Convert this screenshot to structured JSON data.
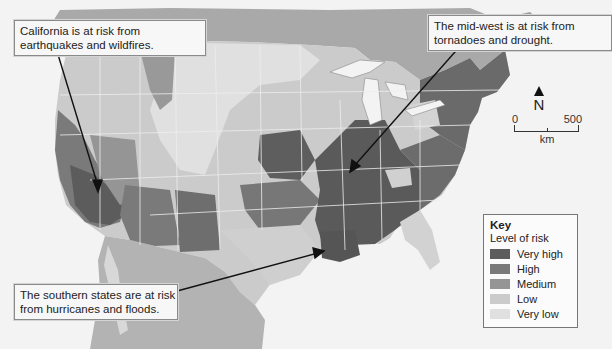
{
  "map": {
    "title": "Natural hazard risk levels across the United States",
    "callouts": [
      {
        "id": "california",
        "lines": [
          "California is at risk from",
          "earthquakes and wildfires."
        ]
      },
      {
        "id": "midwest",
        "lines": [
          "The mid-west is at risk from",
          "tornadoes and drought."
        ]
      },
      {
        "id": "south",
        "lines": [
          "The southern states are at risk",
          "from hurricanes and floods."
        ]
      }
    ],
    "key": {
      "title": "Key",
      "subtitle": "Level of risk",
      "levels": [
        {
          "label": "Very high",
          "color": "#5c5c5c"
        },
        {
          "label": "High",
          "color": "#7a7a7a"
        },
        {
          "label": "Medium",
          "color": "#959595"
        },
        {
          "label": "Low",
          "color": "#cbcbcb"
        },
        {
          "label": "Very low",
          "color": "#e0e0e0"
        }
      ]
    },
    "north_arrow": {
      "label": "N"
    },
    "scale_bar": {
      "start": "0",
      "end": "500",
      "unit": "km"
    },
    "colors": {
      "ocean": "#f3f3f3",
      "canada": "#a9a9a9",
      "mexico": "#b3b3b3",
      "state_border": "#eeeeee"
    }
  }
}
